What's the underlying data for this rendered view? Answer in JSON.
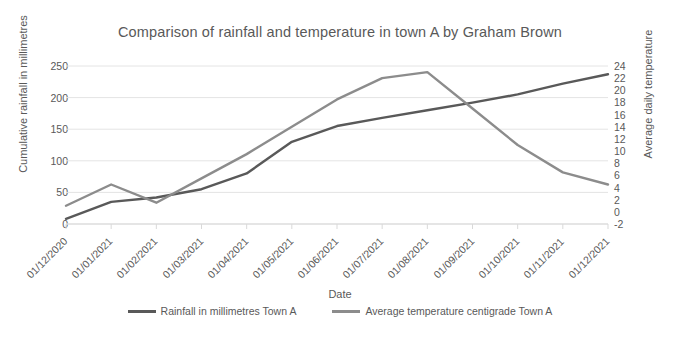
{
  "chart_data": {
    "type": "line",
    "title": "Comparison of rainfall and temperature in town A by Graham Brown",
    "xlabel": "Date",
    "ylabel": "Cumulative rainfall in millimetres",
    "ylabel_secondary": "Average daily temperature",
    "grid": true,
    "legend_position": "bottom",
    "categories": [
      "01/12/2020",
      "01/01/2021",
      "01/02/2021",
      "01/03/2021",
      "01/04/2021",
      "01/05/2021",
      "01/06/2021",
      "01/07/2021",
      "01/08/2021",
      "01/09/2021",
      "01/10/2021",
      "01/11/2021",
      "01/12/2021"
    ],
    "yticks_left": [
      0,
      50,
      100,
      150,
      200,
      250
    ],
    "ylim": [
      0,
      250
    ],
    "yticks_right": [
      -2,
      0,
      2,
      4,
      6,
      8,
      10,
      12,
      14,
      16,
      18,
      20,
      22,
      24
    ],
    "ylim_right": [
      -2,
      24
    ],
    "series": [
      {
        "name": "Rainfall in millimetres Town A",
        "axis": "left",
        "color": "#595959",
        "values": [
          8,
          35,
          42,
          55,
          80,
          130,
          155,
          168,
          180,
          192,
          205,
          222,
          237
        ]
      },
      {
        "name": "Average temperature centigrade Town A",
        "axis": "right",
        "color": "#8c8c8c",
        "values": [
          1,
          4.5,
          1.5,
          5.5,
          9.5,
          14,
          18.5,
          22,
          23,
          17,
          11,
          6.5,
          4.5
        ]
      }
    ]
  }
}
